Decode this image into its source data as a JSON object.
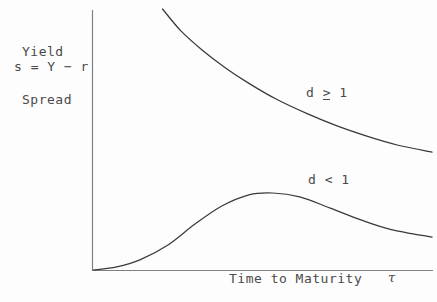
{
  "figure": {
    "background_color": "#fdfdfd",
    "axis_color": "#808080",
    "curve_color": "#3a3a3a",
    "text_color": "#4a4a4a"
  },
  "axes": {
    "y_label_line1": "Yield",
    "y_label_line2": "Spread",
    "y_label_formula": "s = Y − r",
    "x_label": "Time to Maturity",
    "x_label_symbol": "τ"
  },
  "annotations": {
    "upper_curve_label_prefix": "d ",
    "upper_curve_label_relation": "≥",
    "upper_curve_label_relation_glyph": ">",
    "upper_curve_label_suffix": " 1",
    "upper_curve_label_full": "d ≥ 1",
    "lower_curve_label": "d < 1"
  },
  "chart_data": {
    "type": "line",
    "title": "",
    "subtitle": "",
    "xlabel": "Time to Maturity τ",
    "ylabel": "Yield Spread  s = Y − r",
    "grid": false,
    "legend_position": "inline-annotations",
    "axis_ticks": {
      "x": [],
      "y": []
    },
    "xlim": [
      0,
      1
    ],
    "ylim": [
      0,
      1
    ],
    "series": [
      {
        "name": "d ≥ 1",
        "description": "Monotonically decreasing convex credit spread curve; starts high above plot top and decays toward a positive asymptote.",
        "x": [
          0.205,
          0.26,
          0.32,
          0.39,
          0.46,
          0.54,
          0.63,
          0.72,
          0.81,
          0.9,
          1.0
        ],
        "y": [
          1.0,
          0.915,
          0.845,
          0.775,
          0.715,
          0.655,
          0.6,
          0.552,
          0.512,
          0.478,
          0.452
        ]
      },
      {
        "name": "d < 1",
        "description": "Hump-shaped credit spread curve; rises from zero at origin, peaks at intermediate maturity, then decays.",
        "x": [
          0.0,
          0.07,
          0.14,
          0.22,
          0.3,
          0.38,
          0.46,
          0.53,
          0.61,
          0.7,
          0.79,
          0.88,
          1.0
        ],
        "y": [
          0.0,
          0.012,
          0.04,
          0.095,
          0.175,
          0.245,
          0.288,
          0.295,
          0.28,
          0.237,
          0.192,
          0.155,
          0.126
        ]
      }
    ]
  }
}
